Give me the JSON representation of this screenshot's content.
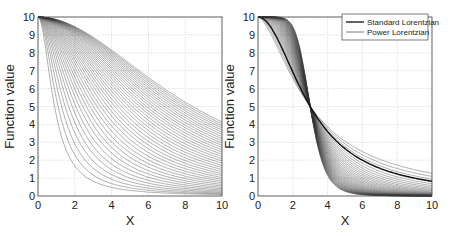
{
  "chart_data": [
    {
      "type": "line",
      "title": "",
      "xlabel": "X",
      "ylabel": "Function value",
      "xlim": [
        0,
        10
      ],
      "ylim": [
        0,
        10
      ],
      "xticks": [
        0,
        2,
        4,
        6,
        8,
        10
      ],
      "yticks": [
        0,
        1,
        2,
        3,
        4,
        5,
        6,
        7,
        8,
        9,
        10
      ],
      "grid": true,
      "legend": null,
      "description": "Family of ~40 Lorentzian-like decay curves starting at 10 at x=0; widths increase gradually, ending values at x=10 range from ~0 to ~5",
      "series": [
        {
          "name": "narrowest",
          "x": [
            0,
            1,
            2,
            3,
            4,
            6,
            8,
            10
          ],
          "values": [
            10,
            5,
            2,
            1.1,
            0.6,
            0.3,
            0.15,
            0.1
          ]
        },
        {
          "name": "widest",
          "x": [
            0,
            1,
            2,
            3,
            4,
            6,
            8,
            10
          ],
          "values": [
            10,
            9.8,
            9.3,
            8.5,
            7.8,
            6.5,
            5.6,
            4.9
          ]
        }
      ]
    },
    {
      "type": "line",
      "title": "",
      "xlabel": "X",
      "ylabel": "Function value",
      "xlim": [
        0,
        10
      ],
      "ylim": [
        0,
        10
      ],
      "xticks": [
        0,
        2,
        4,
        6,
        8,
        10
      ],
      "yticks": [
        0,
        1,
        2,
        3,
        4,
        5,
        6,
        7,
        8,
        9,
        10
      ],
      "grid": true,
      "legend": {
        "position": "upper right",
        "entries": [
          "Standard Lorentzian",
          "Power Lorentzian"
        ]
      },
      "description": "Family of power Lorentzian curves all crossing at (3, 5); standard Lorentzian shown as thicker line",
      "series": [
        {
          "name": "Standard Lorentzian",
          "x": [
            0,
            1,
            2,
            3,
            4,
            6,
            8,
            10
          ],
          "values": [
            10,
            9,
            6.9,
            5,
            3.6,
            2,
            1.2,
            0.8
          ]
        },
        {
          "name": "Power Lorentzian (steepest)",
          "x": [
            0,
            1,
            2,
            3,
            4,
            6,
            8,
            10
          ],
          "values": [
            10,
            9.9,
            8.8,
            5,
            1.5,
            0.2,
            0.05,
            0.02
          ]
        },
        {
          "name": "Power Lorentzian (flattest)",
          "x": [
            0,
            1,
            2,
            3,
            4,
            6,
            8,
            10
          ],
          "values": [
            10,
            8.2,
            6.2,
            5,
            4.2,
            3.2,
            2.6,
            2.2
          ]
        }
      ]
    }
  ]
}
